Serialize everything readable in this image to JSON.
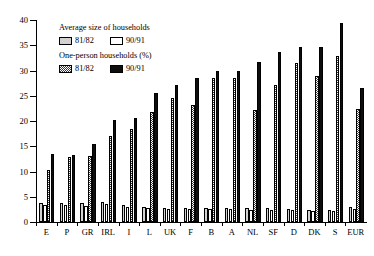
{
  "chart_data": {
    "type": "bar",
    "title": "",
    "xlabel": "",
    "ylabel": "",
    "ylim": [
      0,
      40
    ],
    "yticks": [
      0,
      5,
      10,
      15,
      20,
      25,
      30,
      35,
      40
    ],
    "grid": false,
    "legend_position": "upper-left inside",
    "categories": [
      "E",
      "P",
      "GR",
      "IRL",
      "I",
      "L",
      "UK",
      "F",
      "B",
      "A",
      "NL",
      "SF",
      "D",
      "DK",
      "S",
      "EUR"
    ],
    "series": [
      {
        "name": "Average size of households 81/82",
        "key": "avg81",
        "fill": "light-grey",
        "values": [
          3.8,
          3.7,
          3.7,
          3.9,
          3.4,
          3.0,
          2.7,
          2.8,
          2.8,
          2.7,
          2.8,
          2.7,
          2.5,
          2.4,
          2.4,
          2.9
        ]
      },
      {
        "name": "Average size of households 90/91",
        "key": "avg91",
        "fill": "white",
        "values": [
          3.4,
          3.3,
          3.1,
          3.5,
          2.9,
          2.7,
          2.5,
          2.6,
          2.5,
          2.5,
          2.4,
          2.4,
          2.3,
          2.2,
          2.2,
          2.6
        ]
      },
      {
        "name": "One-person households (%) 81/82",
        "key": "one81",
        "fill": "checkered",
        "values": [
          10.3,
          12.8,
          13.0,
          17.0,
          18.5,
          21.8,
          24.6,
          23.1,
          28.6,
          28.6,
          22.2,
          27.1,
          31.5,
          29.0,
          32.9,
          22.3
        ]
      },
      {
        "name": "One-person households (%) 90/91",
        "key": "one91",
        "fill": "black",
        "values": [
          13.4,
          13.2,
          15.5,
          20.3,
          20.6,
          25.6,
          27.2,
          28.6,
          29.9,
          30.0,
          31.7,
          33.6,
          34.6,
          34.6,
          39.5,
          26.5
        ]
      }
    ]
  },
  "legend": {
    "group1_title": "Average size of households",
    "group1_items": [
      {
        "label": "81/82",
        "swatch": "avg81"
      },
      {
        "label": "90/91",
        "swatch": "avg91"
      }
    ],
    "group2_title": "One-person households (%)",
    "group2_items": [
      {
        "label": "81/82",
        "swatch": "one81"
      },
      {
        "label": "90/91",
        "swatch": "one91"
      }
    ]
  },
  "colors": {
    "axis": "#000000",
    "avg81": "#d2d2d2",
    "avg91": "#ffffff",
    "one81_hatch": "#3a3a3a",
    "one91": "#0d0d0d",
    "background": "#ffffff"
  }
}
